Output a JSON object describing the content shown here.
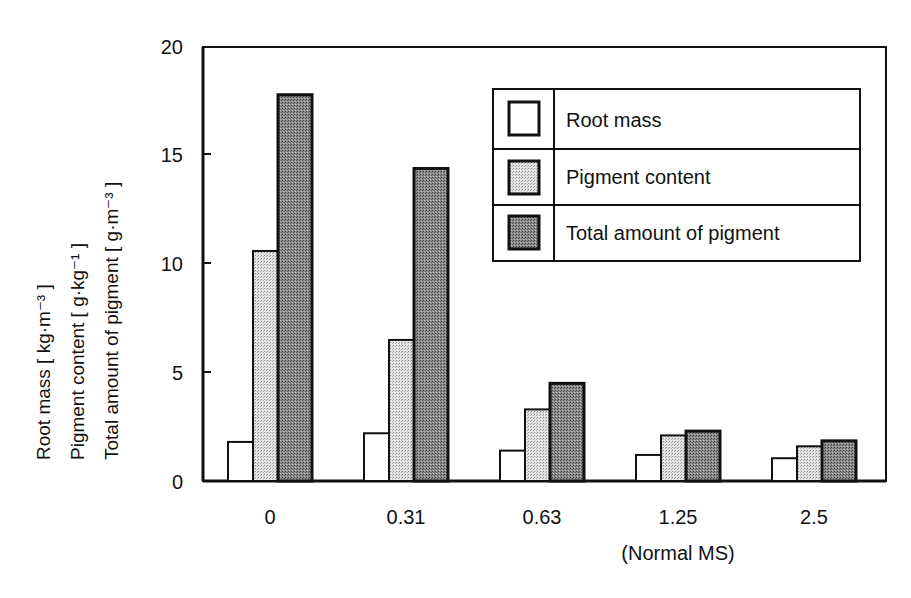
{
  "chart_data": {
    "type": "bar",
    "title": "",
    "xlabel": "",
    "ylabel_lines": [
      "Root mass  [ kg·m⁻³ ]",
      "Pigment content  [ g·kg⁻¹ ]",
      "Total amount of pigment  [ g·m⁻³ ]"
    ],
    "ylim": [
      0,
      20
    ],
    "yticks": [
      0,
      5,
      10,
      15,
      20
    ],
    "categories": [
      "0",
      "0.31",
      "0.63",
      "1.25",
      "2.5"
    ],
    "category_sublabels": [
      "",
      "",
      "",
      "(Normal MS)",
      ""
    ],
    "series": [
      {
        "name": "Root mass",
        "values": [
          1.8,
          2.2,
          1.4,
          1.2,
          1.05
        ],
        "fill": "#ffffff"
      },
      {
        "name": "Pigment content",
        "values": [
          10.6,
          6.5,
          3.3,
          2.1,
          1.6
        ],
        "fill": "#cfcfcf"
      },
      {
        "name": "Total amount of pigment",
        "values": [
          17.8,
          14.4,
          4.5,
          2.3,
          1.85
        ],
        "fill": "#7a7a7a"
      }
    ],
    "legend": {
      "position": "upper-right-inside",
      "entries": [
        "Root mass",
        "Pigment content",
        "Total amount of pigment"
      ]
    },
    "grid": false
  }
}
